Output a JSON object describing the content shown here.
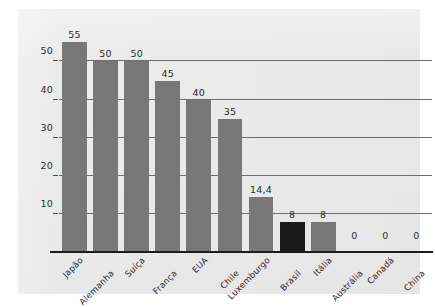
{
  "chart_data": {
    "type": "bar",
    "title": "",
    "subtitle": "",
    "xlabel": "",
    "ylabel": "",
    "categories": [
      "Japão",
      "Alemanha",
      "Suíça",
      "França",
      "EUA",
      "Chile",
      "Luxemburgo",
      "Brasil",
      "Itália",
      "Austrália",
      "Canadá",
      "China"
    ],
    "values": [
      55,
      50,
      50,
      45,
      40,
      35,
      14.4,
      8,
      8,
      0,
      0,
      0
    ],
    "value_labels": [
      "55",
      "50",
      "50",
      "45",
      "40",
      "35",
      "14,4",
      "8",
      "8",
      "0",
      "0",
      "0"
    ],
    "highlight_index": 7,
    "bar_color": "#787878",
    "highlight_color": "#1a1a1a",
    "ylim": [
      0,
      58
    ],
    "yticks": [
      10,
      20,
      30,
      40,
      50
    ],
    "ytick_labels": [
      "10",
      "20",
      "30",
      "40",
      "50"
    ],
    "grid": true,
    "legend": false,
    "panel_color": "#ebebeb",
    "axis_color": "#1c1c1c",
    "gridline_color": "#6d6d6d"
  }
}
